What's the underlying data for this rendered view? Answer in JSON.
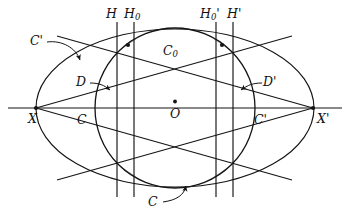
{
  "figure": {
    "type": "geometry-diagram",
    "title": "",
    "background_color": "#ffffff",
    "stroke_color": "#141414",
    "shade_color": "#a8a8a8",
    "width": 350,
    "height": 218
  },
  "labels": {
    "outer_conic": "C'",
    "inner_conic_top": "C",
    "inner_conic_subscript": "0",
    "inner_conic_bottom": "C",
    "region_left": "D",
    "region_right": "D'",
    "hyperplane_left": "H",
    "hyperplane_left_zero": "H",
    "hyperplane_left_zero_subscript": "0",
    "hyperplane_right_zero": "H",
    "hyperplane_right_zero_subscript": "0",
    "hyperplane_right_zero_prime": "'",
    "hyperplane_right": "H",
    "hyperplane_right_prime": "'",
    "vertex_left": "X",
    "vertex_right": "X'",
    "chord_left": "C",
    "chord_right": "C'",
    "center": "O"
  },
  "geometry": {
    "center": {
      "x": 175,
      "y": 108,
      "label": "O"
    },
    "axis_line": {
      "x1": 8,
      "y1": 108,
      "x2": 342,
      "y2": 108
    },
    "outer_ellipse": {
      "cx": 175,
      "cy": 108,
      "rx": 139,
      "ry": 79
    },
    "inner_circle": {
      "cx": 175,
      "cy": 108,
      "r": 80
    },
    "vertex_left": {
      "x": 36,
      "y": 108
    },
    "vertex_right": {
      "x": 313,
      "y": 108
    },
    "vertical_lines": [
      {
        "name": "H",
        "x": 117
      },
      {
        "name": "H0",
        "x": 134
      },
      {
        "name": "H0prime",
        "x": 216
      },
      {
        "name": "Hprime",
        "x": 233
      }
    ],
    "marked_points": [
      {
        "x": 128,
        "y": 45
      },
      {
        "x": 222,
        "y": 45
      }
    ]
  }
}
